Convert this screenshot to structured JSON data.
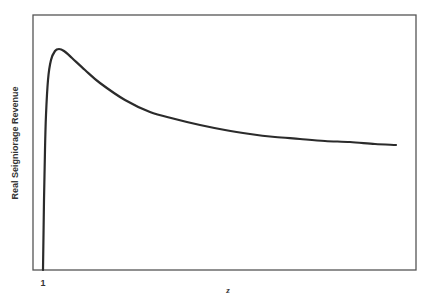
{
  "chart_data": {
    "type": "line",
    "title": "",
    "xlabel": "z",
    "ylabel": "Real Seigniorage Revenue",
    "x_tick_labels": [
      "1"
    ],
    "y_tick_labels": [],
    "grid": false,
    "legend": null,
    "series": [
      {
        "name": "Real Seigniorage Revenue",
        "description": "Rises steeply from zero at z=1 to a peak shortly after, then declines and flattens toward an asymptote",
        "points_px": [
          [
            43,
            270
          ],
          [
            44,
            200
          ],
          [
            45,
            150
          ],
          [
            46,
            115
          ],
          [
            48,
            80
          ],
          [
            51,
            60
          ],
          [
            55,
            51
          ],
          [
            59,
            49
          ],
          [
            64,
            51
          ],
          [
            72,
            58
          ],
          [
            85,
            70
          ],
          [
            100,
            83
          ],
          [
            125,
            100
          ],
          [
            150,
            112
          ],
          [
            175,
            119
          ],
          [
            200,
            125
          ],
          [
            225,
            130
          ],
          [
            250,
            134
          ],
          [
            275,
            137
          ],
          [
            300,
            139
          ],
          [
            325,
            141
          ],
          [
            350,
            142
          ],
          [
            375,
            144
          ],
          [
            396,
            145
          ]
        ]
      }
    ],
    "frame_px": {
      "left": 33,
      "top": 15,
      "right": 416,
      "bottom": 270
    }
  },
  "labels": {
    "ylabel": "Real Seigniorage Revenue",
    "xlabel": "z",
    "xtick": "1"
  },
  "colors": {
    "line": "#2b2b2b",
    "frame": "#555555",
    "background": "#ffffff"
  }
}
